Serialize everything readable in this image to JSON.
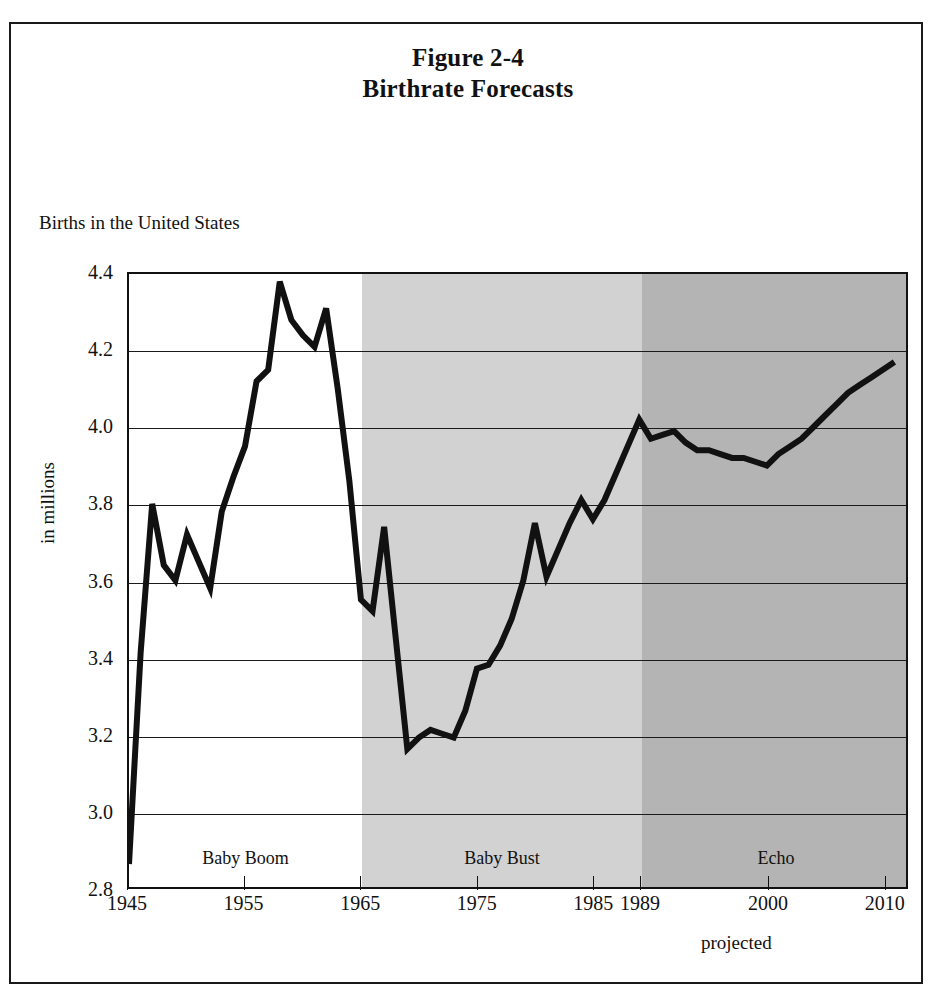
{
  "figure": {
    "title_line1": "Figure 2-4",
    "title_line2": "Birthrate Forecasts",
    "subtitle": "Births in the United States",
    "projected_note": "projected"
  },
  "axes": {
    "y_title": "in millions",
    "y_ticks": [
      "4.4",
      "4.2",
      "4.0",
      "3.8",
      "3.6",
      "3.4",
      "3.2",
      "3.0",
      "2.8"
    ],
    "x_ticks": [
      "1945",
      "1955",
      "1965",
      "1975",
      "1985",
      "1989",
      "2000",
      "2010"
    ]
  },
  "bands": [
    {
      "label": "Baby Boom",
      "color": "#ffffff",
      "start_year": 1945,
      "end_year": 1965
    },
    {
      "label": "Baby Bust",
      "color": "#d2d2d2",
      "start_year": 1965,
      "end_year": 1989
    },
    {
      "label": "Echo",
      "color": "#b4b4b4",
      "start_year": 1989,
      "end_year": 2012
    }
  ],
  "chart_data": {
    "type": "line",
    "title": "Figure 2-4 Birthrate Forecasts",
    "subtitle": "Births in the United States",
    "xlabel": "",
    "ylabel": "in millions",
    "ylim": [
      2.8,
      4.4
    ],
    "xlim": [
      1945,
      2012
    ],
    "grid": true,
    "legend": "none",
    "y_ticks": [
      2.8,
      3.0,
      3.2,
      3.4,
      3.6,
      3.8,
      4.0,
      4.2,
      4.4
    ],
    "x_ticks": [
      1945,
      1955,
      1965,
      1975,
      1985,
      1989,
      2000,
      2010
    ],
    "annotations": [
      "Baby Boom",
      "Baby Bust",
      "Echo",
      "projected"
    ],
    "series": [
      {
        "name": "Births in the United States",
        "color": "#111111",
        "x": [
          1945,
          1946,
          1947,
          1948,
          1949,
          1950,
          1951,
          1952,
          1953,
          1954,
          1955,
          1956,
          1957,
          1958,
          1959,
          1960,
          1961,
          1962,
          1963,
          1964,
          1965,
          1966,
          1967,
          1968,
          1969,
          1970,
          1971,
          1972,
          1973,
          1974,
          1975,
          1976,
          1977,
          1978,
          1979,
          1980,
          1981,
          1982,
          1983,
          1984,
          1985,
          1986,
          1987,
          1988,
          1989,
          1990,
          1991,
          1992,
          1993,
          1994,
          1995,
          1996,
          1997,
          1998,
          1999,
          2000,
          2001,
          2002,
          2003,
          2004,
          2005,
          2006,
          2007,
          2008,
          2009,
          2010,
          2011
        ],
        "y": [
          2.86,
          3.41,
          3.8,
          3.64,
          3.6,
          3.72,
          3.65,
          3.58,
          3.78,
          3.87,
          3.95,
          4.12,
          4.15,
          4.38,
          4.28,
          4.24,
          4.21,
          4.31,
          4.1,
          3.86,
          3.55,
          3.52,
          3.74,
          3.45,
          3.16,
          3.19,
          3.21,
          3.2,
          3.19,
          3.26,
          3.37,
          3.38,
          3.43,
          3.5,
          3.6,
          3.75,
          3.61,
          3.68,
          3.75,
          3.81,
          3.76,
          3.81,
          3.88,
          3.95,
          4.02,
          3.97,
          3.98,
          3.99,
          3.96,
          3.94,
          3.94,
          3.93,
          3.92,
          3.92,
          3.91,
          3.9,
          3.93,
          3.95,
          3.97,
          4.0,
          4.03,
          4.06,
          4.09,
          4.11,
          4.13,
          4.15,
          4.17
        ]
      }
    ]
  }
}
